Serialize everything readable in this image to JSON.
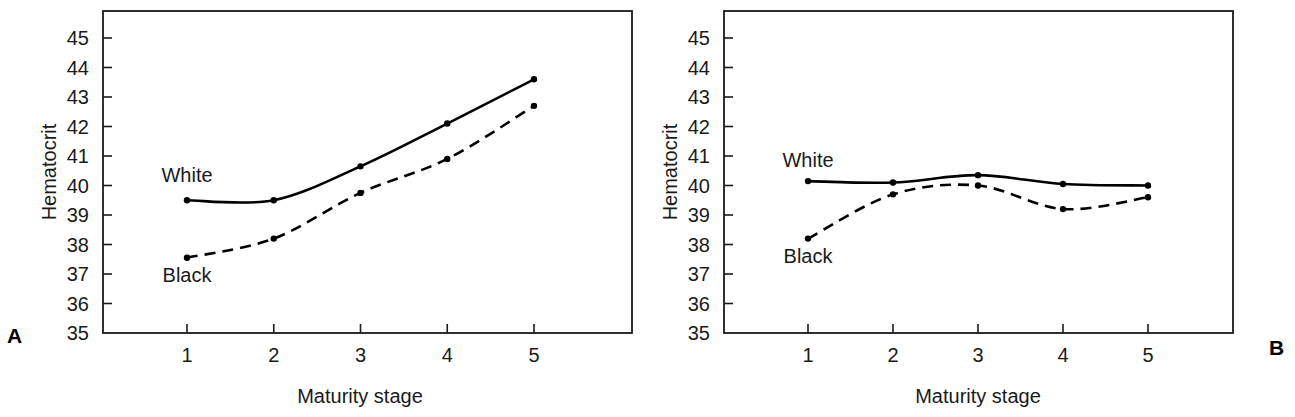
{
  "figure": {
    "panels": [
      {
        "letter": "A",
        "y_axis_title": "Hematocrit",
        "x_axis_title": "Maturity stage",
        "y_tick_labels": [
          "45",
          "44",
          "43",
          "42",
          "41",
          "40",
          "39",
          "38",
          "37",
          "36",
          "35"
        ],
        "x_tick_labels": [
          "1",
          "2",
          "3",
          "4",
          "5"
        ],
        "series_labels": {
          "white": "White",
          "black": "Black"
        }
      },
      {
        "letter": "B",
        "y_axis_title": "Hematocrit",
        "x_axis_title": "Maturity stage",
        "y_tick_labels": [
          "45",
          "44",
          "43",
          "42",
          "41",
          "40",
          "39",
          "38",
          "37",
          "36",
          "35"
        ],
        "x_tick_labels": [
          "1",
          "2",
          "3",
          "4",
          "5"
        ],
        "series_labels": {
          "white": "White",
          "black": "Black"
        }
      }
    ]
  },
  "chart_data": [
    {
      "type": "line",
      "panel": "A",
      "title": "",
      "xlabel": "Maturity stage",
      "ylabel": "Hematocrit",
      "x": [
        1,
        2,
        3,
        4,
        5
      ],
      "categories": [
        "1",
        "2",
        "3",
        "4",
        "5"
      ],
      "xlim": [
        0.45,
        6.1
      ],
      "ylim": [
        35,
        45.9
      ],
      "yticks": [
        35,
        36,
        37,
        38,
        39,
        40,
        41,
        42,
        43,
        44,
        45
      ],
      "xticks": [
        1,
        2,
        3,
        4,
        5
      ],
      "grid": false,
      "legend": "inline-labels",
      "series": [
        {
          "name": "White",
          "values": [
            39.5,
            39.5,
            40.65,
            42.1,
            43.6
          ],
          "linestyle": "solid",
          "color": "#000000",
          "marker": "filled-circle"
        },
        {
          "name": "Black",
          "values": [
            37.55,
            38.2,
            39.75,
            40.9,
            42.7
          ],
          "linestyle": "dashed",
          "color": "#000000",
          "marker": "filled-circle"
        }
      ],
      "annotations": [
        {
          "text": "White",
          "x": 1.0,
          "y": 40.35
        },
        {
          "text": "Black",
          "x": 1.0,
          "y": 36.95
        },
        {
          "text": "A",
          "x": 0.0,
          "y": 35.2
        }
      ]
    },
    {
      "type": "line",
      "panel": "B",
      "title": "",
      "xlabel": "Maturity stage",
      "ylabel": "Hematocrit",
      "x": [
        1,
        2,
        3,
        4,
        5
      ],
      "categories": [
        "1",
        "2",
        "3",
        "4",
        "5"
      ],
      "xlim": [
        0.45,
        6.05
      ],
      "ylim": [
        35,
        45.9
      ],
      "yticks": [
        35,
        36,
        37,
        38,
        39,
        40,
        41,
        42,
        43,
        44,
        45
      ],
      "xticks": [
        1,
        2,
        3,
        4,
        5
      ],
      "grid": false,
      "legend": "inline-labels",
      "series": [
        {
          "name": "White",
          "values": [
            40.15,
            40.1,
            40.35,
            40.05,
            40.0
          ],
          "linestyle": "solid",
          "color": "#000000",
          "marker": "filled-circle"
        },
        {
          "name": "Black",
          "values": [
            38.2,
            39.7,
            40.0,
            39.2,
            39.6
          ],
          "linestyle": "dashed",
          "color": "#000000",
          "marker": "filled-circle"
        }
      ],
      "annotations": [
        {
          "text": "White",
          "x": 1.0,
          "y": 40.85
        },
        {
          "text": "Black",
          "x": 1.0,
          "y": 37.6
        },
        {
          "text": "B",
          "x": 6.2,
          "y": 35.1
        }
      ]
    }
  ]
}
